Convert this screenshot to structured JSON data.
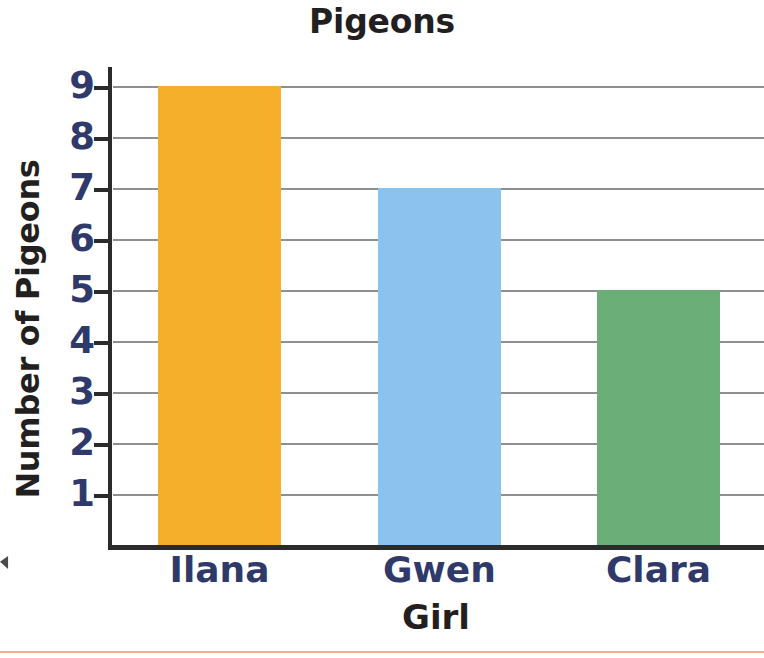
{
  "chart_data": {
    "type": "bar",
    "title": "Pigeons",
    "xlabel": "Girl",
    "ylabel": "Number of Pigeons",
    "categories": [
      "Ilana",
      "Gwen",
      "Clara"
    ],
    "values": [
      9,
      7,
      5
    ],
    "ylim": [
      0,
      9.35
    ],
    "ytick_labels": [
      "1",
      "2",
      "3",
      "4",
      "5",
      "6",
      "7",
      "8",
      "9"
    ],
    "ytick_values": [
      1,
      2,
      3,
      4,
      5,
      6,
      7,
      8,
      9
    ],
    "grid": "horizontal",
    "legend": "none",
    "bar_colors": [
      "#F5AF2B",
      "#8CC3EE",
      "#6BAE78"
    ],
    "label_color": "#2F3A6B",
    "title_color": "#231F20",
    "axis_color": "#2B2B2B",
    "gridline_color": "#8D8F91",
    "bottom_rule_color": "#F0A07E"
  }
}
